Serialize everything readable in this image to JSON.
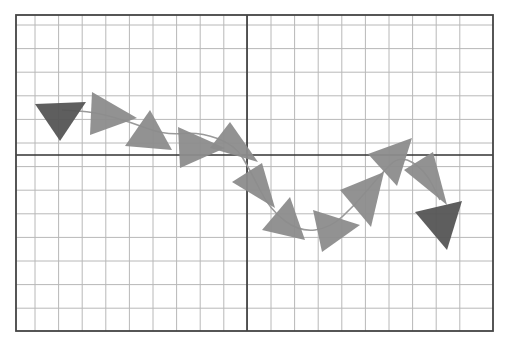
{
  "diagram": {
    "grid": {
      "cols": 20,
      "rows": 13,
      "axis_col": 10,
      "axis_row": 6
    },
    "colors": {
      "grid": "#b8b8b8",
      "axis": "#333333",
      "frame": "#444444",
      "triangle": "#8c8c8c",
      "triangle_end": "#555555",
      "curve": "#9a9a9a"
    },
    "curve_points": [
      [
        0.05,
        0.62
      ],
      [
        0.18,
        0.56
      ],
      [
        0.32,
        0.42
      ],
      [
        0.44,
        0.44
      ],
      [
        0.5,
        0.4
      ],
      [
        0.54,
        0.28
      ],
      [
        0.62,
        0.14
      ],
      [
        0.7,
        0.22
      ],
      [
        0.8,
        0.46
      ],
      [
        0.88,
        0.52
      ],
      [
        0.94,
        0.32
      ]
    ],
    "triangles": [
      {
        "pts": [
          [
            0.04,
            0.56
          ],
          [
            0.15,
            0.57
          ],
          [
            0.09,
            0.69
          ]
        ],
        "shade": "end"
      },
      {
        "pts": [
          [
            0.16,
            0.63
          ],
          [
            0.24,
            0.56
          ],
          [
            0.16,
            0.52
          ]
        ],
        "shade": "normal"
      },
      {
        "pts": [
          [
            0.25,
            0.55
          ],
          [
            0.33,
            0.48
          ],
          [
            0.22,
            0.47
          ]
        ],
        "shade": "normal"
      },
      {
        "pts": [
          [
            0.34,
            0.54
          ],
          [
            0.42,
            0.47
          ],
          [
            0.34,
            0.4
          ]
        ],
        "shade": "normal"
      },
      {
        "pts": [
          [
            0.4,
            0.49
          ],
          [
            0.48,
            0.49
          ],
          [
            0.44,
            0.58
          ]
        ],
        "shade": "normal"
      },
      {
        "pts": [
          [
            0.45,
            0.48
          ],
          [
            0.52,
            0.46
          ],
          [
            0.48,
            0.56
          ]
        ],
        "shade": "normal"
      },
      {
        "pts": [
          [
            0.47,
            0.41
          ],
          [
            0.53,
            0.33
          ],
          [
            0.55,
            0.45
          ]
        ],
        "shade": "normal"
      },
      {
        "pts": [
          [
            0.53,
            0.36
          ],
          [
            0.58,
            0.24
          ],
          [
            0.49,
            0.29
          ]
        ],
        "shade": "normal"
      },
      {
        "pts": [
          [
            0.53,
            0.26
          ],
          [
            0.6,
            0.2
          ],
          [
            0.56,
            0.32
          ]
        ],
        "shade": "normal"
      },
      {
        "pts": [
          [
            0.64,
            0.32
          ],
          [
            0.73,
            0.28
          ],
          [
            0.67,
            0.17
          ]
        ],
        "shade": "normal"
      },
      {
        "pts": [
          [
            0.71,
            0.36
          ],
          [
            0.76,
            0.5
          ],
          [
            0.78,
            0.4
          ]
        ],
        "shade": "normal"
      },
      {
        "pts": [
          [
            0.76,
            0.49
          ],
          [
            0.84,
            0.57
          ],
          [
            0.85,
            0.43
          ]
        ],
        "shade": "normal"
      },
      {
        "pts": [
          [
            0.81,
            0.57
          ],
          [
            0.87,
            0.67
          ],
          [
            0.89,
            0.58
          ]
        ],
        "shade": "normal"
      },
      {
        "pts": [
          [
            0.89,
            0.26
          ],
          [
            0.97,
            0.26
          ],
          [
            0.94,
            0.4
          ]
        ],
        "shade": "end"
      }
    ]
  }
}
